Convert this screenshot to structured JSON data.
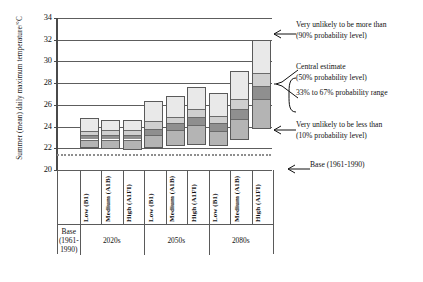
{
  "chart_data": {
    "type": "bar",
    "title": "",
    "subtitle": "",
    "xlabel": "",
    "ylabel": "Summer (mean) daily maximum temperature/°C",
    "ylim": [
      20,
      34
    ],
    "ytick_values": [
      20,
      22,
      24,
      26,
      28,
      30,
      32,
      34
    ],
    "ytick_labels": [
      "20",
      "22",
      "24",
      "26",
      "28",
      "30",
      "32",
      "34"
    ],
    "grid": true,
    "legend_position": "right-annotations",
    "baseline": {
      "label": "Base (1961-1990)",
      "value": 21.4
    },
    "band_definition": [
      "10% probability level (lower whisker of box)",
      "33% probability level",
      "50% probability level (central estimate)",
      "67% probability level",
      "90% probability level (upper end of box)"
    ],
    "groups": [
      {
        "name": "Base (1961-1990)",
        "scenarios": []
      },
      {
        "name": "2020s",
        "scenarios": [
          "Low (B1)",
          "Medium (A1B)",
          "High (A1FI)"
        ]
      },
      {
        "name": "2050s",
        "scenarios": [
          "Low (B1)",
          "Medium (A1B)",
          "High (A1FI)"
        ]
      },
      {
        "name": "2080s",
        "scenarios": [
          "Low (B1)",
          "Medium (A1B)",
          "High (A1FI)"
        ]
      }
    ],
    "categories": [
      "2020s Low (B1)",
      "2020s Medium (A1B)",
      "2020s High (A1FI)",
      "2050s Low (B1)",
      "2050s Medium (A1B)",
      "2050s High (A1FI)",
      "2080s Low (B1)",
      "2080s Medium (A1B)",
      "2080s High (A1FI)"
    ],
    "bars": [
      {
        "category": "2020s Low (B1)",
        "p10": 22.0,
        "p33": 22.9,
        "p50": 23.3,
        "p67": 23.7,
        "p90": 24.8
      },
      {
        "category": "2020s Medium (A1B)",
        "p10": 21.9,
        "p33": 22.9,
        "p50": 23.3,
        "p67": 23.8,
        "p90": 24.6
      },
      {
        "category": "2020s High (A1FI)",
        "p10": 21.8,
        "p33": 22.9,
        "p50": 23.3,
        "p67": 23.8,
        "p90": 24.6
      },
      {
        "category": "2050s Low (B1)",
        "p10": 22.0,
        "p33": 23.3,
        "p50": 23.9,
        "p67": 24.6,
        "p90": 26.4
      },
      {
        "category": "2050s Medium (A1B)",
        "p10": 22.2,
        "p33": 23.8,
        "p50": 24.4,
        "p67": 25.0,
        "p90": 26.8
      },
      {
        "category": "2050s High (A1FI)",
        "p10": 22.3,
        "p33": 24.2,
        "p50": 25.0,
        "p67": 25.7,
        "p90": 27.6
      },
      {
        "category": "2080s Low (B1)",
        "p10": 22.2,
        "p33": 23.7,
        "p50": 24.4,
        "p67": 25.1,
        "p90": 27.1
      },
      {
        "category": "2080s Medium (A1B)",
        "p10": 22.8,
        "p33": 24.8,
        "p50": 25.7,
        "p67": 26.6,
        "p90": 29.1
      },
      {
        "category": "2080s High (A1FI)",
        "p10": 23.8,
        "p33": 26.6,
        "p50": 27.8,
        "p67": 29.0,
        "p90": 32.0
      }
    ],
    "annotations": [
      {
        "id": "upper",
        "line1": "Very unlikely to be more than",
        "line2": "(90% probability level)"
      },
      {
        "id": "central",
        "line1": "Central estimate",
        "line2": "(50% probability level)"
      },
      {
        "id": "range",
        "line1": "33% to 67% probability range",
        "line2": ""
      },
      {
        "id": "lower",
        "line1": "Very unlikely to be less than",
        "line2": "(10% probability level)"
      },
      {
        "id": "base",
        "line1": "Base (1961-1990)",
        "line2": ""
      }
    ],
    "band_colors": [
      "#e9e9e9",
      "#cfcfcf",
      "#8f8f8f",
      "#b4b4b4",
      "#dcdcdc"
    ]
  }
}
